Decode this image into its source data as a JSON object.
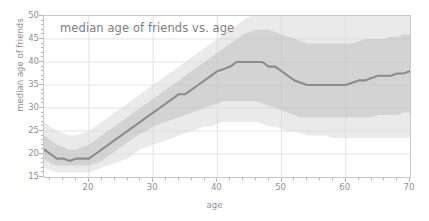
{
  "chart_data": {
    "type": "line",
    "title": "median age of friends vs. age",
    "xlabel": "age",
    "ylabel": "median age of friends",
    "xlim": [
      13,
      70
    ],
    "ylim": [
      15,
      50
    ],
    "xticks": [
      20,
      30,
      40,
      50,
      60,
      70
    ],
    "yticks": [
      15,
      20,
      25,
      30,
      35,
      40,
      45,
      50
    ],
    "xtick_labels": [
      "20",
      "30",
      "40",
      "50",
      "60",
      "70"
    ],
    "ytick_labels": [
      "15",
      "20",
      "25",
      "30",
      "35",
      "40",
      "45",
      "50"
    ],
    "minor_tick_step": 2,
    "grid": true,
    "legend": null,
    "line_color": "#8c8c8c",
    "band_color": "#c8c8c8",
    "grid_color": "#e2e2e2",
    "x": [
      13,
      14,
      15,
      16,
      17,
      18,
      19,
      20,
      21,
      22,
      23,
      24,
      25,
      26,
      27,
      28,
      29,
      30,
      31,
      32,
      33,
      34,
      35,
      36,
      37,
      38,
      39,
      40,
      41,
      42,
      43,
      44,
      45,
      46,
      47,
      48,
      49,
      50,
      51,
      52,
      53,
      54,
      55,
      56,
      57,
      58,
      59,
      60,
      61,
      62,
      63,
      64,
      65,
      66,
      67,
      68,
      69,
      70
    ],
    "series": [
      {
        "name": "median",
        "values": [
          21,
          20,
          19,
          19,
          18.5,
          19,
          19,
          19,
          20,
          21,
          22,
          23,
          24,
          25,
          26,
          27,
          28,
          29,
          30,
          31,
          32,
          33,
          33,
          34,
          35,
          36,
          37,
          38,
          38.5,
          39,
          40,
          40,
          40,
          40,
          40,
          39,
          39,
          38,
          37,
          36,
          35.5,
          35,
          35,
          35,
          35,
          35,
          35,
          35,
          35.5,
          36,
          36,
          36.5,
          37,
          37,
          37,
          37.5,
          37.5,
          38
        ]
      },
      {
        "name": "band_lower",
        "values": [
          17,
          16.5,
          16,
          16,
          16,
          16,
          16,
          16,
          16.5,
          17,
          17.5,
          18,
          18.5,
          19,
          20,
          21,
          21.5,
          22,
          22.5,
          23,
          23.5,
          24,
          24.5,
          25,
          25.5,
          26,
          26,
          26.5,
          27,
          27,
          27,
          27,
          27,
          27,
          26.5,
          26,
          26,
          25.5,
          25,
          25,
          24.5,
          24,
          24,
          24,
          24,
          23.5,
          23.5,
          23.5,
          23.5,
          23.5,
          23.5,
          23.5,
          23.5,
          23.5,
          23.5,
          23.5,
          23.5,
          23.5
        ]
      },
      {
        "name": "band_upper",
        "values": [
          27,
          26,
          25,
          24.5,
          24,
          24,
          24.5,
          25,
          26,
          27,
          28,
          29,
          30,
          31,
          32,
          33,
          34,
          35,
          36,
          37,
          38,
          39,
          40,
          41,
          42,
          43,
          44,
          45,
          46,
          47,
          48,
          49,
          50,
          50,
          50,
          50,
          50,
          50,
          50,
          50,
          50,
          50,
          50,
          50,
          50,
          50,
          50,
          50,
          50,
          50,
          50,
          50,
          50,
          50,
          50,
          50,
          50,
          50
        ]
      },
      {
        "name": "inner_lower",
        "values": [
          19,
          18,
          17.5,
          17.5,
          17.5,
          17.5,
          17.5,
          17.5,
          18,
          18.5,
          19.5,
          20.5,
          21.5,
          22.5,
          23.5,
          24.5,
          25,
          26,
          26.5,
          27,
          27.5,
          28,
          28.5,
          29,
          29.5,
          30,
          30.5,
          31,
          31.5,
          31.5,
          31.5,
          31.5,
          31.5,
          31.5,
          31,
          30.5,
          30,
          29.5,
          29,
          28.5,
          28,
          28,
          28,
          28,
          28,
          28,
          28,
          28,
          28,
          28,
          28,
          28,
          28.5,
          28.5,
          28.5,
          28.5,
          29,
          29
        ]
      },
      {
        "name": "inner_upper",
        "values": [
          24,
          23,
          22,
          21.5,
          21,
          21,
          21.5,
          22,
          23,
          24,
          25,
          26,
          27,
          28,
          29,
          30,
          31,
          32,
          33,
          34,
          35,
          36,
          37,
          38,
          39,
          40,
          41,
          42,
          43,
          44,
          45,
          46,
          46.5,
          47,
          47,
          47,
          46.5,
          46,
          45.5,
          45,
          44.5,
          44,
          44,
          44,
          44,
          44,
          44,
          44,
          44,
          44.5,
          45,
          45,
          45,
          45,
          45.5,
          45.5,
          46,
          46
        ]
      }
    ]
  }
}
